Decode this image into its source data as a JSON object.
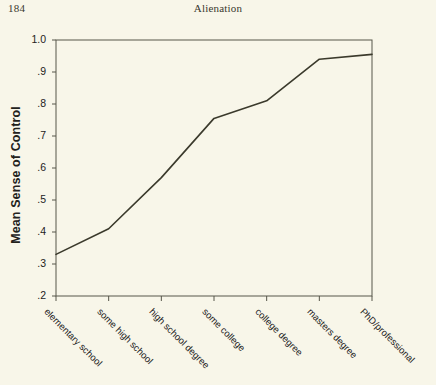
{
  "page": {
    "page_number": "184",
    "running_head": "Alienation",
    "background_color": "#f8f6e9",
    "ink_color": "#23221c"
  },
  "chart_data": {
    "type": "line",
    "title": "",
    "xlabel": "",
    "ylabel": "Mean Sense of Control",
    "categories": [
      "elementary school",
      "some high school",
      "high school degree",
      "some college",
      "college degree",
      "masters degree",
      "PhD/professional"
    ],
    "values": [
      0.33,
      0.41,
      0.57,
      0.755,
      0.81,
      0.94,
      0.955
    ],
    "ylim": [
      0.2,
      1.0
    ],
    "ytick_labels": [
      "1.0",
      ".9",
      ".8",
      ".7",
      ".6",
      ".5",
      ".4",
      ".3",
      ".2"
    ],
    "ytick_values": [
      1.0,
      0.9,
      0.8,
      0.7,
      0.6,
      0.5,
      0.4,
      0.3,
      0.2
    ],
    "grid": false,
    "legend": "none",
    "series": [
      {
        "name": "Mean Sense of Control",
        "values": [
          0.33,
          0.41,
          0.57,
          0.755,
          0.81,
          0.94,
          0.955
        ],
        "color": "#3b3a2c"
      }
    ],
    "xtick_label_rotation": 45
  }
}
